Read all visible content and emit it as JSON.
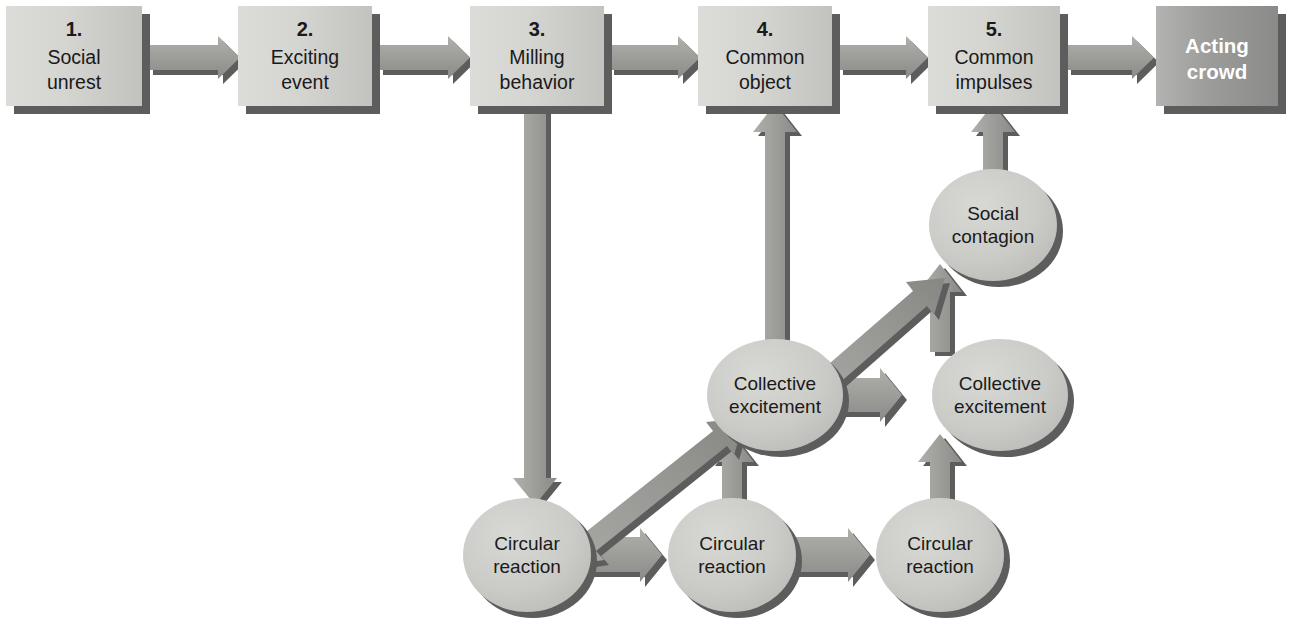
{
  "diagram": {
    "colors": {
      "box_fill_light": "#d2d2cf",
      "box_fill_light_edge": "#bdbdba",
      "terminal_fill": "#9d9d9b",
      "ellipse_fill": "#c9c9c5",
      "shadow": "#575757",
      "arrow_fill": "#9b9b98",
      "arrow_shade": "#6e6e6c",
      "text_dark": "#1a1a1a",
      "text_light": "#ffffff",
      "background": "#ffffff"
    },
    "stages": [
      {
        "number": "1.",
        "line1": "Social",
        "line2": "unrest"
      },
      {
        "number": "2.",
        "line1": "Exciting",
        "line2": "event"
      },
      {
        "number": "3.",
        "line1": "Milling",
        "line2": "behavior"
      },
      {
        "number": "4.",
        "line1": "Common",
        "line2": "object"
      },
      {
        "number": "5.",
        "line1": "Common",
        "line2": "impulses"
      }
    ],
    "terminal": {
      "line1": "Acting",
      "line2": "crowd"
    },
    "nodes": [
      {
        "id": "circular-1",
        "line1": "Circular",
        "line2": "reaction"
      },
      {
        "id": "circular-2",
        "line1": "Circular",
        "line2": "reaction"
      },
      {
        "id": "circular-3",
        "line1": "Circular",
        "line2": "reaction"
      },
      {
        "id": "collective-1",
        "line1": "Collective",
        "line2": "excitement"
      },
      {
        "id": "collective-2",
        "line1": "Collective",
        "line2": "excitement"
      },
      {
        "id": "social-contagion",
        "line1": "Social",
        "line2": "contagion"
      }
    ],
    "edges": [
      {
        "from": "stage-1",
        "to": "stage-2",
        "direction": "right"
      },
      {
        "from": "stage-2",
        "to": "stage-3",
        "direction": "right"
      },
      {
        "from": "stage-3",
        "to": "stage-4",
        "direction": "right"
      },
      {
        "from": "stage-4",
        "to": "stage-5",
        "direction": "right"
      },
      {
        "from": "stage-5",
        "to": "terminal",
        "direction": "right"
      },
      {
        "from": "stage-3",
        "to": "circular-1",
        "direction": "down"
      },
      {
        "from": "circular-1",
        "to": "circular-2",
        "direction": "right"
      },
      {
        "from": "circular-2",
        "to": "circular-3",
        "direction": "right"
      },
      {
        "from": "circular-1",
        "to": "collective-1",
        "direction": "up-right"
      },
      {
        "from": "circular-2",
        "to": "collective-1",
        "direction": "up"
      },
      {
        "from": "circular-3",
        "to": "collective-2",
        "direction": "up"
      },
      {
        "from": "collective-1",
        "to": "collective-2",
        "direction": "right"
      },
      {
        "from": "collective-1",
        "to": "social-contagion",
        "direction": "up-right"
      },
      {
        "from": "collective-2",
        "to": "social-contagion",
        "direction": "up"
      },
      {
        "from": "collective-1",
        "to": "stage-4",
        "direction": "up"
      },
      {
        "from": "social-contagion",
        "to": "stage-5",
        "direction": "up"
      }
    ]
  }
}
